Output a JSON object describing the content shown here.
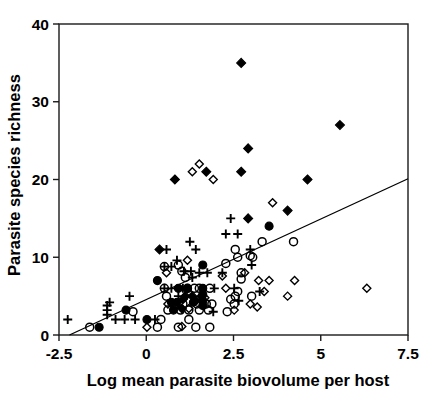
{
  "chart_data": {
    "type": "scatter",
    "title": "",
    "xlabel": "Log mean parasite biovolume per host",
    "ylabel": "Parasite species richness",
    "xlim": [
      -2.5,
      7.5
    ],
    "ylim": [
      0,
      40
    ],
    "xticks": [
      -2.5,
      0,
      2.5,
      5,
      7.5
    ],
    "xtick_labels": [
      "-2.5",
      "0",
      "2.5",
      "5",
      "7.5"
    ],
    "yticks": [
      0,
      10,
      20,
      30,
      40
    ],
    "ytick_labels": [
      "0",
      "10",
      "20",
      "30",
      "40"
    ],
    "grid": false,
    "legend": "none",
    "frame": "box",
    "marker_styles": {
      "filled-diamond": {
        "shape": "diamond",
        "fill": "#000000",
        "stroke": "#000000",
        "size": 9
      },
      "open-diamond": {
        "shape": "diamond",
        "fill": "none",
        "stroke": "#000000",
        "size": 8
      },
      "filled-circle": {
        "shape": "circle",
        "fill": "#000000",
        "stroke": "#000000",
        "size": 8
      },
      "open-circle": {
        "shape": "circle",
        "fill": "none",
        "stroke": "#000000",
        "size": 8
      },
      "plus": {
        "shape": "plus",
        "fill": "none",
        "stroke": "#000000",
        "size": 9
      }
    },
    "trendline": {
      "type": "line",
      "x": [
        -2.2,
        7.5
      ],
      "y": [
        0.0,
        20.1
      ],
      "color": "#000000",
      "width": 1.3
    },
    "series": [
      {
        "name": "filled-diamond",
        "marker": "filled-diamond",
        "points": [
          [
            2.72,
            35.0
          ],
          [
            5.55,
            27.0
          ],
          [
            2.92,
            24.0
          ],
          [
            2.72,
            21.0
          ],
          [
            1.72,
            21.0
          ],
          [
            0.82,
            20.0
          ],
          [
            4.62,
            20.0
          ],
          [
            4.05,
            16.0
          ],
          [
            2.92,
            15.0
          ],
          [
            0.38,
            11.0
          ],
          [
            1.58,
            5.0
          ],
          [
            1.12,
            5.0
          ],
          [
            1.32,
            5.0
          ],
          [
            1.05,
            4.6
          ],
          [
            1.42,
            4.4
          ],
          [
            1.02,
            3.4
          ]
        ]
      },
      {
        "name": "open-diamond",
        "marker": "open-diamond",
        "points": [
          [
            1.52,
            22.0
          ],
          [
            1.32,
            21.0
          ],
          [
            1.92,
            20.0
          ],
          [
            3.62,
            17.0
          ],
          [
            1.18,
            9.6
          ],
          [
            0.58,
            8.0
          ],
          [
            2.82,
            8.0
          ],
          [
            3.22,
            7.0
          ],
          [
            3.52,
            7.0
          ],
          [
            4.25,
            7.0
          ],
          [
            6.32,
            6.0
          ],
          [
            3.38,
            5.6
          ],
          [
            4.05,
            5.0
          ],
          [
            2.98,
            4.0
          ],
          [
            3.18,
            3.6
          ],
          [
            2.52,
            3.2
          ],
          [
            1.68,
            4.8
          ],
          [
            2.18,
            7.6
          ],
          [
            2.28,
            6.0
          ],
          [
            0.02,
            1.0
          ],
          [
            1.02,
            1.1
          ],
          [
            0.62,
            4.0
          ],
          [
            1.22,
            3.4
          ]
        ]
      },
      {
        "name": "filled-circle",
        "marker": "filled-circle",
        "points": [
          [
            3.52,
            14.0
          ],
          [
            1.62,
            9.0
          ],
          [
            0.32,
            7.0
          ],
          [
            -0.58,
            3.2
          ],
          [
            0.02,
            2.0
          ],
          [
            -1.35,
            1.0
          ],
          [
            1.62,
            6.0
          ],
          [
            1.18,
            6.0
          ],
          [
            0.92,
            6.0
          ],
          [
            1.62,
            5.2
          ],
          [
            1.62,
            4.4
          ],
          [
            1.62,
            3.8
          ],
          [
            0.72,
            4.2
          ],
          [
            0.88,
            4.2
          ],
          [
            1.35,
            4.2
          ],
          [
            0.78,
            3.2
          ]
        ]
      },
      {
        "name": "open-circle",
        "marker": "open-circle",
        "points": [
          [
            4.22,
            12.0
          ],
          [
            3.32,
            12.0
          ],
          [
            2.55,
            11.0
          ],
          [
            2.62,
            10.0
          ],
          [
            3.05,
            10.0
          ],
          [
            2.98,
            10.2
          ],
          [
            0.92,
            9.0
          ],
          [
            1.02,
            8.2
          ],
          [
            2.72,
            8.0
          ],
          [
            2.72,
            7.2
          ],
          [
            1.12,
            7.4
          ],
          [
            1.18,
            6.0
          ],
          [
            1.38,
            6.0
          ],
          [
            1.52,
            6.0
          ],
          [
            1.82,
            6.0
          ],
          [
            2.62,
            5.6
          ],
          [
            2.55,
            5.0
          ],
          [
            3.02,
            5.0
          ],
          [
            2.42,
            4.6
          ],
          [
            2.52,
            4.0
          ],
          [
            0.82,
            4.0
          ],
          [
            1.05,
            4.0
          ],
          [
            1.45,
            4.0
          ],
          [
            1.72,
            4.0
          ],
          [
            1.88,
            4.0
          ],
          [
            0.62,
            3.2
          ],
          [
            0.98,
            3.2
          ],
          [
            1.22,
            3.2
          ],
          [
            1.52,
            3.2
          ],
          [
            1.78,
            3.2
          ],
          [
            -1.62,
            1.0
          ],
          [
            -0.38,
            3.0
          ],
          [
            0.42,
            2.0
          ],
          [
            0.32,
            1.0
          ],
          [
            0.92,
            1.0
          ],
          [
            1.42,
            1.0
          ],
          [
            1.82,
            1.0
          ],
          [
            2.32,
            3.0
          ],
          [
            1.22,
            2.0
          ],
          [
            0.52,
            8.8
          ],
          [
            0.52,
            6.0
          ],
          [
            0.58,
            5.0
          ],
          [
            2.28,
            9.2
          ]
        ]
      },
      {
        "name": "plus",
        "marker": "plus",
        "points": [
          [
            1.25,
            12.0
          ],
          [
            2.42,
            15.0
          ],
          [
            2.28,
            13.0
          ],
          [
            2.62,
            13.0
          ],
          [
            0.58,
            11.0
          ],
          [
            1.42,
            11.0
          ],
          [
            0.88,
            9.6
          ],
          [
            2.98,
            11.0
          ],
          [
            3.02,
            9.0
          ],
          [
            2.18,
            8.0
          ],
          [
            0.52,
            8.8
          ],
          [
            0.72,
            8.8
          ],
          [
            1.08,
            8.2
          ],
          [
            1.28,
            8.2
          ],
          [
            1.52,
            8.0
          ],
          [
            1.75,
            8.0
          ],
          [
            1.32,
            7.4
          ],
          [
            0.52,
            6.0
          ],
          [
            0.72,
            6.0
          ],
          [
            1.95,
            6.0
          ],
          [
            2.52,
            6.0
          ],
          [
            3.25,
            5.6
          ],
          [
            -0.48,
            5.0
          ],
          [
            -1.12,
            3.8
          ],
          [
            -1.12,
            3.2
          ],
          [
            -1.12,
            2.6
          ],
          [
            -1.05,
            4.2
          ],
          [
            -0.62,
            2.0
          ],
          [
            -0.32,
            2.0
          ],
          [
            -2.25,
            2.0
          ],
          [
            0.25,
            2.0
          ],
          [
            1.92,
            3.0
          ],
          [
            2.65,
            4.4
          ],
          [
            -0.88,
            2.0
          ],
          [
            0.92,
            5.0
          ],
          [
            1.05,
            6.0
          ]
        ]
      }
    ]
  }
}
